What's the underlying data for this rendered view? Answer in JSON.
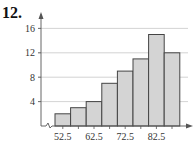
{
  "problem_number": "12.",
  "chart_data": {
    "type": "bar",
    "subtype": "histogram",
    "title": "",
    "xlabel": "",
    "ylabel": "",
    "categories": [
      "52.5",
      "57.5",
      "62.5",
      "67.5",
      "72.5",
      "77.5",
      "82.5",
      "87.5"
    ],
    "values": [
      2,
      3,
      4,
      7,
      9,
      11,
      15,
      12
    ],
    "x_tick_labels": [
      "52.5",
      "62.5",
      "72.5",
      "82.5"
    ],
    "y_tick_labels": [
      "4",
      "8",
      "12",
      "16"
    ],
    "ylim": [
      0,
      17
    ],
    "grid": true,
    "axis_break": true,
    "bar_color": "#d4d4d4",
    "bar_edge_color": "#444444"
  }
}
